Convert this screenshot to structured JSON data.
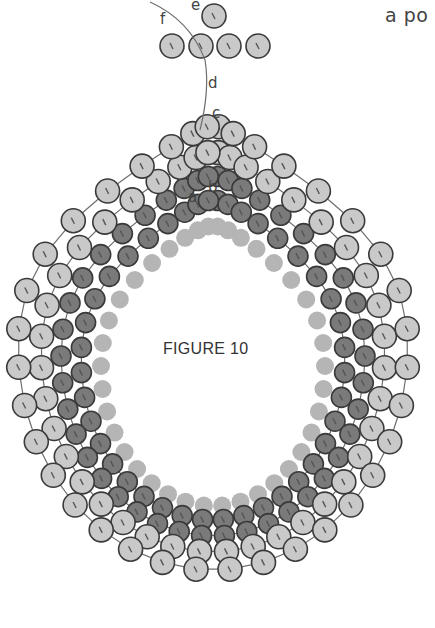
{
  "header": {
    "corner_text": "a po"
  },
  "figure": {
    "title": "FIGURE 10",
    "center": [
      213,
      338
    ],
    "labels": [
      {
        "text": "a",
        "x": 188,
        "y": 188
      },
      {
        "text": "b",
        "x": 208,
        "y": 178
      },
      {
        "text": "c",
        "x": 212,
        "y": 106
      },
      {
        "text": "d",
        "x": 208,
        "y": 76
      },
      {
        "text": "e",
        "x": 191,
        "y": -2
      },
      {
        "text": "f",
        "x": 160,
        "y": 12
      }
    ],
    "colors": {
      "background": "#ffffff",
      "thread": "#6e6e6e",
      "bead_outline": "#3a3a3a",
      "outer_bead_fill": "#c9c9c9",
      "dark_bead_fill": "#7a7a7a",
      "inner_bead_fill": "#b5b5b5",
      "hole_mark": "#555555",
      "label_text": "#444444"
    },
    "rings": [
      {
        "name": "inner-core",
        "rx": 112,
        "ry": 140,
        "cy_offset": 28,
        "top_pull": 0.55,
        "count": 38,
        "r": 9,
        "fill": "inner_bead_fill",
        "outline": false
      },
      {
        "name": "dark-ring-1",
        "rx": 132,
        "ry": 160,
        "cy_offset": 22,
        "top_pull": 0.62,
        "count": 40,
        "r": 10,
        "fill": "dark_bead_fill",
        "outline": true
      },
      {
        "name": "dark-ring-2",
        "rx": 152,
        "ry": 180,
        "cy_offset": 18,
        "top_pull": 0.66,
        "count": 42,
        "r": 10,
        "fill": "dark_bead_fill",
        "outline": true
      },
      {
        "name": "outer-ring-1",
        "rx": 172,
        "ry": 200,
        "cy_offset": 14,
        "top_pull": 0.7,
        "count": 40,
        "r": 12,
        "fill": "outer_bead_fill",
        "outline": true
      },
      {
        "name": "outer-ring-2",
        "rx": 195,
        "ry": 222,
        "cy_offset": 10,
        "top_pull": 0.74,
        "count": 36,
        "r": 12,
        "fill": "outer_bead_fill",
        "outline": true
      }
    ],
    "top_beads": [
      {
        "x": 214,
        "y": 16,
        "r": 12
      },
      {
        "x": 172,
        "y": 46,
        "r": 12
      },
      {
        "x": 201,
        "y": 46,
        "r": 12
      },
      {
        "x": 229,
        "y": 46,
        "r": 12
      },
      {
        "x": 258,
        "y": 46,
        "r": 12
      }
    ]
  }
}
